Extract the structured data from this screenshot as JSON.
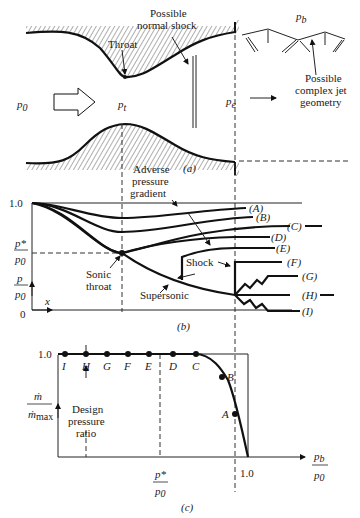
{
  "panel_a": {
    "caption": "(a)",
    "labels": {
      "throat": "Throat",
      "possible_normal_shock_1": "Possible",
      "possible_normal_shock_2": "normal shock",
      "p0": "p",
      "p0_sub": "0",
      "pt": "p",
      "pt_sub": "t",
      "pe": "p",
      "pe_sub": "e",
      "pb": "p",
      "pb_sub": "b",
      "jet_1": "Possible",
      "jet_2": "complex jet",
      "jet_3": "geometry"
    }
  },
  "panel_b": {
    "caption": "(b)",
    "y_tick_top": "1.0",
    "y_tick_bottom": "0",
    "pstar_num": "p*",
    "pstar_den": "p",
    "pstar_den_sub": "0",
    "yaxis_num": "p",
    "yaxis_den": "p",
    "yaxis_den_sub": "0",
    "x_label": "x",
    "annotations": {
      "adverse_1": "Adverse",
      "adverse_2": "pressure",
      "adverse_3": "gradient",
      "sonic_1": "Sonic",
      "sonic_2": "throat",
      "shock": "Shock",
      "supersonic": "Supersonic"
    },
    "curve_labels": [
      "(A)",
      "(B)",
      "(C)",
      "(D)",
      "(E)",
      "(F)",
      "(G)",
      "(H)",
      "(I)"
    ]
  },
  "panel_c": {
    "caption": "(c)",
    "y_tick_top": "1.0",
    "ylabel_num": "ṁ",
    "ylabel_den": "ṁ",
    "ylabel_den_sub": "max",
    "x_tick_one": "1.0",
    "x_tick_pstar_num": "p*",
    "x_tick_pstar_den": "p",
    "x_tick_pstar_den_sub": "0",
    "xlabel_num": "p",
    "xlabel_num_sub": "b",
    "xlabel_den": "p",
    "xlabel_den_sub": "0",
    "design_1": "Design",
    "design_2": "pressure",
    "design_3": "ratio",
    "points": [
      "I",
      "H",
      "G",
      "F",
      "E",
      "D",
      "C",
      "B",
      "A"
    ]
  }
}
